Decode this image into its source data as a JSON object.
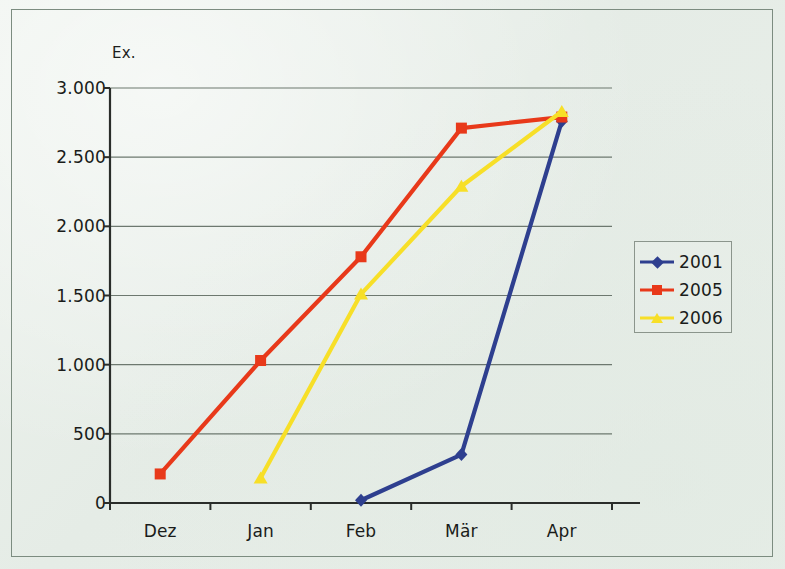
{
  "chart_data": {
    "type": "line",
    "title": "",
    "subtitle": "",
    "xlabel": "",
    "ylabel": "Ex.",
    "categories": [
      "Dez",
      "Jan",
      "Feb",
      "Mär",
      "Apr"
    ],
    "ylim": [
      0,
      3000
    ],
    "ytick_labels": [
      "0",
      "500",
      "1.000",
      "1.500",
      "2.000",
      "2.500",
      "3.000"
    ],
    "ytick_values": [
      0,
      500,
      1000,
      1500,
      2000,
      2500,
      3000
    ],
    "grid": "horizontal",
    "legend_position": "right",
    "series": [
      {
        "name": "2001",
        "color": "#2e3f8f",
        "marker": "diamond",
        "values": [
          null,
          null,
          20,
          350,
          2760
        ]
      },
      {
        "name": "2005",
        "color": "#e8391a",
        "marker": "square",
        "values": [
          210,
          1030,
          1780,
          2710,
          2790
        ]
      },
      {
        "name": "2006",
        "color": "#f7df28",
        "marker": "triangle",
        "values": [
          null,
          180,
          1510,
          2290,
          2830
        ]
      }
    ]
  },
  "legend": {
    "entries": [
      {
        "label": "2001"
      },
      {
        "label": "2005"
      },
      {
        "label": "2006"
      }
    ]
  },
  "axes": {
    "unit_label": "Ex."
  },
  "colors": {
    "background": "#e8eee8",
    "frame": "#7c8c80",
    "axis": "#2a2d2a",
    "grid": "#6d786f",
    "series_2001": "#2e3f8f",
    "series_2005": "#e8391a",
    "series_2006": "#f7df28"
  }
}
